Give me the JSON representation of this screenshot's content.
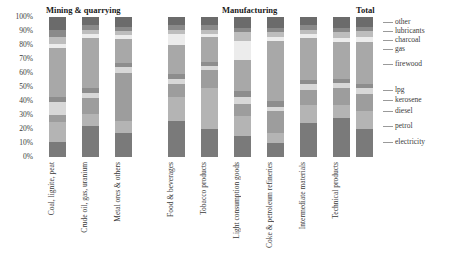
{
  "chart_data": {
    "type": "bar",
    "title": "",
    "subtitle": "",
    "stacked": true,
    "normalized": "100%",
    "xlabel": "",
    "ylabel": "",
    "ylim": [
      0,
      100
    ],
    "ytick_labels": [
      "100%",
      "90%",
      "80%",
      "70%",
      "60%",
      "50%",
      "40%",
      "30%",
      "20%",
      "10%",
      "0%"
    ],
    "ytick_values": [
      100,
      90,
      80,
      70,
      60,
      50,
      40,
      30,
      20,
      10,
      0
    ],
    "grid": false,
    "legend_position": "right",
    "group_headers": [
      {
        "label": "Mining & quarrying",
        "categories": [
          "Coal, lignite, peat",
          "Crude oil, gas, uranium",
          "Metal ores & others"
        ]
      },
      {
        "label": "Manufacturing",
        "categories": [
          "Food & beverages",
          "Tobacco products",
          "Light consumption goods",
          "Coke & petroleum refineries",
          "Intermediate materials",
          "Technical products"
        ]
      }
    ],
    "categories": [
      "Coal, lignite, peat",
      "Crude oil, gas, uranium",
      "Metal ores & others",
      "Food & beverages",
      "Tobacco products",
      "Light consumption goods",
      "Coke & petroleum refineries",
      "Intermediate materials",
      "Technical products",
      "Total"
    ],
    "series": [
      {
        "name": "electricity",
        "color": "#7a7a7a",
        "values": [
          11,
          22,
          17,
          26,
          20,
          15,
          10,
          24,
          28,
          20
        ]
      },
      {
        "name": "petrol",
        "color": "#b4b4b4",
        "values": [
          14,
          9,
          9,
          17,
          29,
          14,
          7,
          13,
          9,
          13
        ]
      },
      {
        "name": "diesel",
        "color": "#9d9d9d",
        "values": [
          5,
          11,
          34,
          9,
          13,
          9,
          16,
          11,
          12,
          12
        ]
      },
      {
        "name": "kerosene",
        "color": "#d8d8d8",
        "values": [
          9,
          4,
          4,
          4,
          3,
          5,
          3,
          4,
          4,
          4
        ]
      },
      {
        "name": "lpg",
        "color": "#8d8d8d",
        "values": [
          4,
          3,
          3,
          3,
          3,
          4,
          4,
          3,
          3,
          3
        ]
      },
      {
        "name": "firewood",
        "color": "#a8a8a8",
        "values": [
          35,
          36,
          17,
          21,
          18,
          22,
          43,
          30,
          26,
          30
        ]
      },
      {
        "name": "gas",
        "color": "#ececec",
        "values": [
          3,
          3,
          3,
          8,
          2,
          14,
          3,
          3,
          3,
          4
        ]
      },
      {
        "name": "charcoal",
        "color": "#bdbdbd",
        "values": [
          5,
          3,
          3,
          3,
          3,
          6,
          3,
          3,
          4,
          4
        ]
      },
      {
        "name": "lubricants",
        "color": "#8a8a8a",
        "values": [
          5,
          3,
          3,
          3,
          3,
          3,
          3,
          3,
          3,
          3
        ]
      },
      {
        "name": "other",
        "color": "#6b6b6b",
        "values": [
          9,
          6,
          7,
          6,
          6,
          8,
          8,
          6,
          8,
          7
        ]
      }
    ],
    "legend_entries": [
      "other",
      "lubricants",
      "charcoal",
      "gas",
      "firewood",
      "lpg",
      "kerosene",
      "diesel",
      "petrol",
      "electricity"
    ]
  }
}
